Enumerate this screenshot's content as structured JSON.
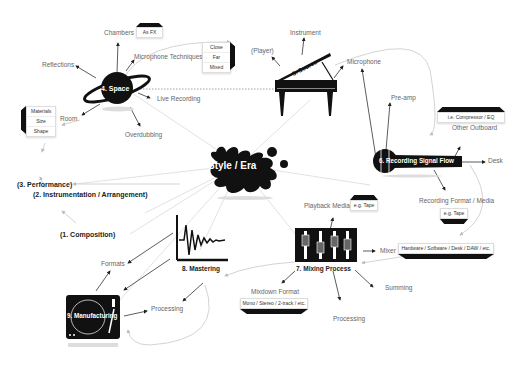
{
  "center": {
    "label": "Style / Era"
  },
  "nodes": {
    "space": {
      "label": "4. Space"
    },
    "source": {
      "label": "5. Source"
    },
    "recording": {
      "label": "6. Recording Signal Flow"
    },
    "mixing": {
      "label": "7. Mixing Process"
    },
    "mastering": {
      "label": "8. Mastering"
    },
    "manufacturing": {
      "label": "9. Manufacturing"
    }
  },
  "stages": {
    "performance": "(3. Performance)",
    "instrumentation": "(2. Instrumentation / Arrangement)",
    "composition": "(1. Composition)"
  },
  "space_branches": {
    "chambers": "Chambers",
    "as_fx": "As FX",
    "reflections": "Reflections",
    "mic_techniques": "Microphone Techniques",
    "mic_options": [
      "Close",
      "Far",
      "Mixed"
    ],
    "room": "Room",
    "room_options": [
      "Materials",
      "Size",
      "Shape"
    ],
    "live_recording": "Live Recording",
    "overdubbing": "Overdubbing"
  },
  "source_branches": {
    "instrument": "Instrument",
    "player": "(Player)",
    "microphone": "Microphone"
  },
  "recording_branches": {
    "pre_amp": "Pre-amp",
    "outboard_example": "i.e. Compressor / EQ",
    "other_outboard": "Other Outboard",
    "desk": "Desk",
    "recording_format": "Recording Format / Media",
    "recording_format_example": "e.g. Tape"
  },
  "mixing_branches": {
    "playback_media": "Playback Media",
    "playback_example": "e.g. Tape",
    "mixer": "Mixer",
    "mixer_example": "Hardware / Software / Desk / DAW / etc.",
    "summing": "Summing",
    "processing": "Processing",
    "mixdown_format": "Mixdown Format",
    "mixdown_example": "Mono / Stereo / 2-track / etc."
  },
  "mastering_branches": {
    "formats": "Formats",
    "processing": "Processing"
  },
  "colors": {
    "node": "#111111",
    "line": "#cccccc",
    "arrow": "#333333",
    "text": "#666666"
  }
}
